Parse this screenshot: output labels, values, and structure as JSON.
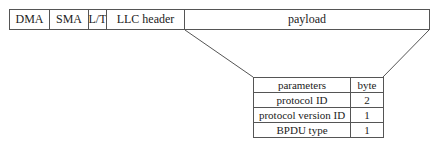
{
  "frame": {
    "fields": [
      {
        "label": "DMA",
        "width": 41
      },
      {
        "label": "SMA",
        "width": 40
      },
      {
        "label": "L/T",
        "width": 19
      },
      {
        "label": "LLC header",
        "width": 79
      },
      {
        "label": "payload",
        "width": 246
      }
    ]
  },
  "table": {
    "headers": [
      "parameters",
      "byte"
    ],
    "rows": [
      {
        "parameter": "protocol ID",
        "byte": "2"
      },
      {
        "parameter": "protocol version ID",
        "byte": "1"
      },
      {
        "parameter": "BPDU type",
        "byte": "1"
      }
    ]
  },
  "colors": {
    "line": "#555555",
    "text": "#222222",
    "background": "#ffffff"
  }
}
